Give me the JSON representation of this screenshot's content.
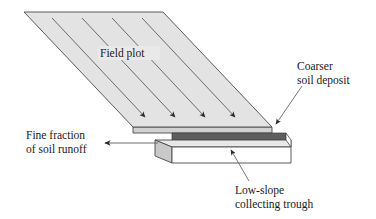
{
  "figure": {
    "title_visible": false,
    "background_color": "#ffffff",
    "width": 376,
    "height": 219
  },
  "labels": {
    "field_plot": "Field plot",
    "coarser_soil_deposit_line1": "Coarser",
    "coarser_soil_deposit_line2": "soil deposit",
    "fine_fraction_line1": "Fine fraction",
    "fine_fraction_line2": "of soil runoff",
    "low_slope_trough_line1": "Low-slope",
    "low_slope_trough_line2": "collecting trough"
  },
  "colors": {
    "plot_fill": "#e3e3e3",
    "plot_edge": "#4a4a4a",
    "trough_face_fill": "#ffffff",
    "trough_top_fill": "#e8e8e8",
    "trough_end_fill": "#c9c9c9",
    "deposit_fill": "#5e5e5e",
    "line": "#555555",
    "text": "#1a1a1a"
  },
  "geometry": {
    "plot": {
      "top_left": [
        24,
        12
      ],
      "top_right": [
        163,
        12
      ],
      "bottom_right": [
        272,
        127
      ],
      "bottom_left": [
        133,
        127
      ]
    },
    "flow_arrow_count": 4,
    "flow_arrows": [
      {
        "x1": 52,
        "y1": 18,
        "x2": 147,
        "y2": 119
      },
      {
        "x1": 82,
        "y1": 18,
        "x2": 177,
        "y2": 119
      },
      {
        "x1": 112,
        "y1": 18,
        "x2": 207,
        "y2": 119
      },
      {
        "x1": 142,
        "y1": 18,
        "x2": 237,
        "y2": 119
      }
    ],
    "runoff_arrow": {
      "x1": 156,
      "y1": 143,
      "x2": 103,
      "y2": 143
    },
    "deposit_leader": {
      "x1": 300,
      "y1": 88,
      "x2": 273,
      "y2": 127
    },
    "trough_leader": {
      "x1": 248,
      "y1": 180,
      "x2": 229,
      "y2": 148
    }
  },
  "annotations": {
    "flow_direction": "downslope",
    "runoff_direction": "left"
  }
}
